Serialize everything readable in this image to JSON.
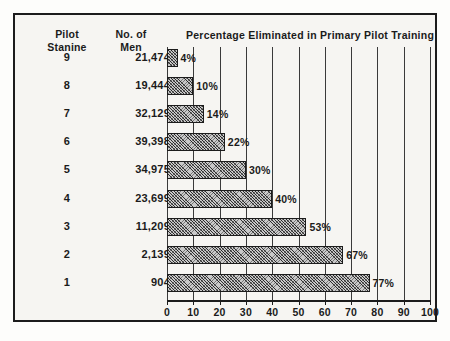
{
  "figure": {
    "background_color": "#f6f5f2",
    "ink_color": "#1b1b1b",
    "bar_fill_color": "#c9c9c9"
  },
  "headers": {
    "stanine_line1": "Pilot",
    "stanine_line2": "Stanine",
    "men_line1": "No. of",
    "men_line2": "Men",
    "chart_title": "Percentage Eliminated in Primary Pilot Training"
  },
  "rows": [
    {
      "stanine": "9",
      "men": "21,474",
      "percent_label": "4%",
      "percent": 4
    },
    {
      "stanine": "8",
      "men": "19,444",
      "percent_label": "10%",
      "percent": 10
    },
    {
      "stanine": "7",
      "men": "32,129",
      "percent_label": "14%",
      "percent": 14
    },
    {
      "stanine": "6",
      "men": "39,398",
      "percent_label": "22%",
      "percent": 22
    },
    {
      "stanine": "5",
      "men": "34,975",
      "percent_label": "30%",
      "percent": 30
    },
    {
      "stanine": "4",
      "men": "23,699",
      "percent_label": "40%",
      "percent": 40
    },
    {
      "stanine": "3",
      "men": "11,209",
      "percent_label": "53%",
      "percent": 53
    },
    {
      "stanine": "2",
      "men": "2,139",
      "percent_label": "67%",
      "percent": 67
    },
    {
      "stanine": "1",
      "men": "904",
      "percent_label": "77%",
      "percent": 77
    }
  ],
  "axis": {
    "ticks": [
      "0",
      "10",
      "20",
      "30",
      "40",
      "50",
      "60",
      "70",
      "80",
      "90",
      "100"
    ],
    "min": 0,
    "max": 100,
    "grid": true
  },
  "chart_data": {
    "type": "bar",
    "orientation": "horizontal",
    "title": "Percentage Eliminated in Primary Pilot Training",
    "xlabel": "",
    "ylabel": "Pilot Stanine",
    "categories": [
      "9",
      "8",
      "7",
      "6",
      "5",
      "4",
      "3",
      "2",
      "1"
    ],
    "values": [
      4,
      10,
      14,
      22,
      30,
      40,
      53,
      67,
      77
    ],
    "data_labels": [
      "4%",
      "10%",
      "14%",
      "22%",
      "30%",
      "40%",
      "53%",
      "67%",
      "77%"
    ],
    "secondary_column": {
      "name": "No. of Men",
      "values": [
        "21,474",
        "19,444",
        "32,129",
        "39,398",
        "34,975",
        "23,699",
        "11,209",
        "2,139",
        "904"
      ]
    },
    "xlim": [
      0,
      100
    ],
    "xticks": [
      0,
      10,
      20,
      30,
      40,
      50,
      60,
      70,
      80,
      90,
      100
    ],
    "grid": true,
    "legend": null
  }
}
